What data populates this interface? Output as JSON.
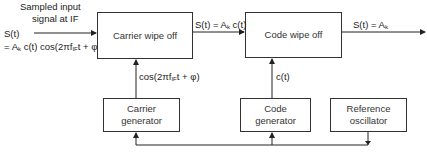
{
  "diagram": {
    "input": {
      "caption_line1": "Sampled input",
      "caption_line2": "signal at IF",
      "signal_line1": "S(t)",
      "signal_line2_prefix": "= A",
      "signal_line2_sub": "k",
      "signal_line2_mid": " c(t) cos(2πf",
      "signal_line2_sub2": "IF",
      "signal_line2_suffix": "t + φ)"
    },
    "blocks": {
      "carrier_wipe_off": "Carrier wipe off",
      "code_wipe_off": "Code wipe off",
      "carrier_generator_line1": "Carrier",
      "carrier_generator_line2": "generator",
      "code_generator_line1": "Code",
      "code_generator_line2": "generator",
      "reference_oscillator_line1": "Reference",
      "reference_oscillator_line2": "oscillator"
    },
    "edges": {
      "between_wipeoffs_prefix": "S(t) = A",
      "between_wipeoffs_sub": "k",
      "between_wipeoffs_suffix": " c(t)",
      "output_prefix": "S(t) = A",
      "output_sub": "k",
      "carrier_ref_prefix": "cos(2πf",
      "carrier_ref_sub": "IF",
      "carrier_ref_suffix": "t + φ)",
      "code_ref": "c(t)"
    }
  }
}
